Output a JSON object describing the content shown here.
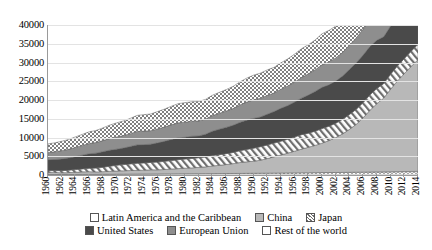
{
  "chart_data": {
    "type": "area",
    "stacked": true,
    "title": "",
    "xlabel": "",
    "ylabel": "",
    "ylim": [
      0,
      40000
    ],
    "ytick_labels": [
      "0",
      "5000",
      "10000",
      "15000",
      "20000",
      "25000",
      "30000",
      "35000",
      "40000"
    ],
    "ytick_values": [
      0,
      5000,
      10000,
      15000,
      20000,
      25000,
      30000,
      35000,
      40000
    ],
    "grid": true,
    "legend_position": "bottom",
    "categories": [
      "1960",
      "1961",
      "1962",
      "1963",
      "1964",
      "1965",
      "1966",
      "1967",
      "1968",
      "1969",
      "1970",
      "1971",
      "1972",
      "1973",
      "1974",
      "1975",
      "1976",
      "1977",
      "1978",
      "1979",
      "1980",
      "1981",
      "1982",
      "1983",
      "1984",
      "1985",
      "1986",
      "1987",
      "1988",
      "1989",
      "1990",
      "1991",
      "1992",
      "1993",
      "1994",
      "1995",
      "1996",
      "1997",
      "1998",
      "1999",
      "2000",
      "2001",
      "2002",
      "2003",
      "2004",
      "2005",
      "2006",
      "2007",
      "2008",
      "2009",
      "2010",
      "2011",
      "2012",
      "2013",
      "2014"
    ],
    "xtick_labels": [
      "1960",
      "1962",
      "1964",
      "1966",
      "1968",
      "1970",
      "1972",
      "1974",
      "1976",
      "1978",
      "1980",
      "1982",
      "1984",
      "1986",
      "1988",
      "1990",
      "1992",
      "1994",
      "1996",
      "1998",
      "2000",
      "2002",
      "2004",
      "2006",
      "2008",
      "2010",
      "2012",
      "2014"
    ],
    "series": [
      {
        "name": "Latin America and the Caribbean",
        "pattern": "wave",
        "color": "#f2f2f2",
        "values": [
          120,
          125,
          130,
          135,
          145,
          155,
          165,
          175,
          185,
          195,
          205,
          215,
          230,
          245,
          255,
          265,
          280,
          295,
          310,
          325,
          340,
          350,
          355,
          360,
          370,
          380,
          390,
          405,
          420,
          435,
          450,
          465,
          480,
          495,
          515,
          535,
          555,
          575,
          595,
          615,
          640,
          655,
          670,
          690,
          715,
          740,
          765,
          795,
          820,
          830,
          870,
          900,
          925,
          950,
          975
        ]
      },
      {
        "name": "China",
        "pattern": "solid-light",
        "color": "#b8b8b8",
        "values": [
          590,
          560,
          470,
          500,
          580,
          680,
          720,
          650,
          700,
          800,
          870,
          910,
          960,
          1000,
          1040,
          1110,
          1100,
          1170,
          1280,
          1380,
          1480,
          1550,
          1680,
          1810,
          2040,
          2200,
          2400,
          2620,
          2900,
          3080,
          3220,
          3480,
          3900,
          4360,
          4830,
          5300,
          5800,
          6330,
          6800,
          7280,
          7850,
          8530,
          9320,
          10280,
          11460,
          12800,
          14500,
          16500,
          18200,
          19700,
          22000,
          24200,
          26100,
          28000,
          29800
        ]
      },
      {
        "name": "Japan",
        "pattern": "diagonal-hatch",
        "color": "#ffffff",
        "values": [
          440,
          500,
          560,
          630,
          720,
          790,
          890,
          1020,
          1170,
          1340,
          1520,
          1650,
          1760,
          1880,
          1920,
          1980,
          2080,
          2170,
          2260,
          2380,
          2440,
          2510,
          2570,
          2640,
          2760,
          2850,
          2900,
          2980,
          3160,
          3310,
          3470,
          3600,
          3630,
          3650,
          3680,
          3700,
          3790,
          3850,
          3770,
          3790,
          3880,
          3830,
          3820,
          3870,
          3960,
          4000,
          4050,
          4120,
          4060,
          3840,
          4020,
          4000,
          4020,
          4060,
          4090
        ]
      },
      {
        "name": "United States",
        "pattern": "solid-dark",
        "color": "#4a4a4a",
        "values": [
          2900,
          2960,
          3130,
          3260,
          3440,
          3660,
          3890,
          3980,
          4160,
          4280,
          4280,
          4420,
          4650,
          4900,
          4880,
          4860,
          5110,
          5340,
          5630,
          5800,
          5790,
          5930,
          5810,
          6070,
          6510,
          6780,
          7010,
          7240,
          7540,
          7800,
          7940,
          7930,
          8200,
          8420,
          8770,
          8980,
          9320,
          9740,
          10150,
          10600,
          11000,
          11020,
          11230,
          11560,
          12000,
          12380,
          12700,
          12900,
          12860,
          12500,
          12830,
          13000,
          13270,
          13500,
          13800
        ]
      },
      {
        "name": "European Union",
        "pattern": "solid-mid",
        "color": "#8e8e8e",
        "values": [
          1950,
          2060,
          2200,
          2320,
          2480,
          2600,
          2740,
          2830,
          2960,
          3120,
          3250,
          3320,
          3430,
          3580,
          3620,
          3600,
          3730,
          3820,
          3900,
          4020,
          4040,
          4000,
          4000,
          4050,
          4160,
          4250,
          4350,
          4460,
          4650,
          4810,
          4950,
          4990,
          5010,
          4950,
          5090,
          5220,
          5330,
          5510,
          5660,
          5790,
          6020,
          6130,
          6190,
          6280,
          6500,
          6660,
          6900,
          7100,
          7120,
          6780,
          6940,
          7060,
          7000,
          7030,
          7180
        ]
      },
      {
        "name": "Rest of the world",
        "pattern": "checker",
        "color": "#9f9f9f",
        "values": [
          2300,
          2380,
          2500,
          2620,
          2800,
          2930,
          3100,
          3220,
          3380,
          3560,
          3760,
          3900,
          4060,
          4280,
          4380,
          4450,
          4620,
          4780,
          4940,
          5120,
          5200,
          5190,
          5180,
          5240,
          5420,
          5570,
          5720,
          5900,
          6150,
          6380,
          6600,
          6700,
          6800,
          6830,
          7030,
          7230,
          7450,
          7680,
          7770,
          7930,
          8280,
          8380,
          8500,
          8700,
          9060,
          9400,
          9800,
          10250,
          10500,
          10200,
          10800,
          11200,
          11500,
          11850,
          12200
        ]
      }
    ]
  },
  "legend": {
    "row1": [
      {
        "label": "Latin America and the Caribbean",
        "key": "latin-america"
      },
      {
        "label": "China",
        "key": "china"
      },
      {
        "label": "Japan",
        "key": "japan"
      }
    ],
    "row2": [
      {
        "label": "United States",
        "key": "united-states"
      },
      {
        "label": "European Union",
        "key": "european-union"
      },
      {
        "label": "Rest of the world",
        "key": "rest-of-world"
      }
    ]
  }
}
